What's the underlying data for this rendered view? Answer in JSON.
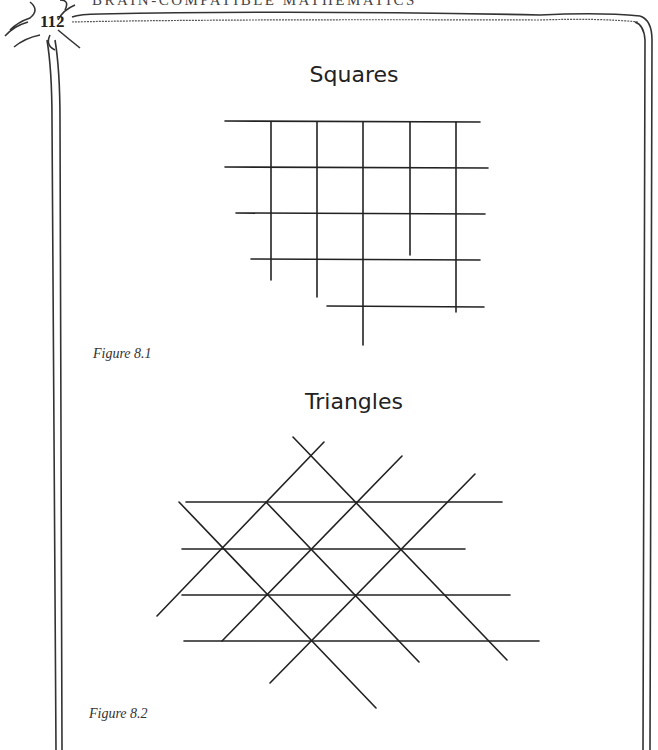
{
  "header": {
    "running_head": "BRAIN-COMPATIBLE MATHEMATICS",
    "page_number": "112"
  },
  "figures": [
    {
      "title": "Squares",
      "caption": "Figure 8.1",
      "shape": "square-grid",
      "horizontal_lines": [
        [
          225,
          121,
          480,
          122
        ],
        [
          225,
          167,
          488,
          168
        ],
        [
          236,
          213,
          485,
          214
        ],
        [
          251,
          259,
          480,
          260
        ],
        [
          327,
          306,
          484,
          307
        ]
      ],
      "vertical_lines": [
        [
          271,
          122,
          271,
          280
        ],
        [
          317,
          122,
          317,
          297
        ],
        [
          363,
          122,
          363,
          345
        ],
        [
          410,
          122,
          410,
          255
        ],
        [
          456,
          122,
          456,
          312
        ]
      ]
    },
    {
      "title": "Triangles",
      "caption": "Figure 8.2",
      "shape": "triangle-lattice",
      "horizontal_lines": [
        [
          186,
          502,
          502,
          502
        ],
        [
          182,
          549,
          465,
          549
        ],
        [
          182,
          595,
          510,
          595
        ],
        [
          184,
          641,
          539,
          641
        ]
      ],
      "diagonal_lines": [
        [
          293,
          437,
          507,
          660
        ],
        [
          179,
          502,
          376,
          708
        ],
        [
          266,
          502,
          419,
          662
        ],
        [
          157,
          616,
          324,
          442
        ],
        [
          222,
          641,
          402,
          456
        ],
        [
          270,
          683,
          475,
          474
        ]
      ]
    }
  ],
  "colors": {
    "ink": "#222222",
    "paper": "#ffffff"
  }
}
